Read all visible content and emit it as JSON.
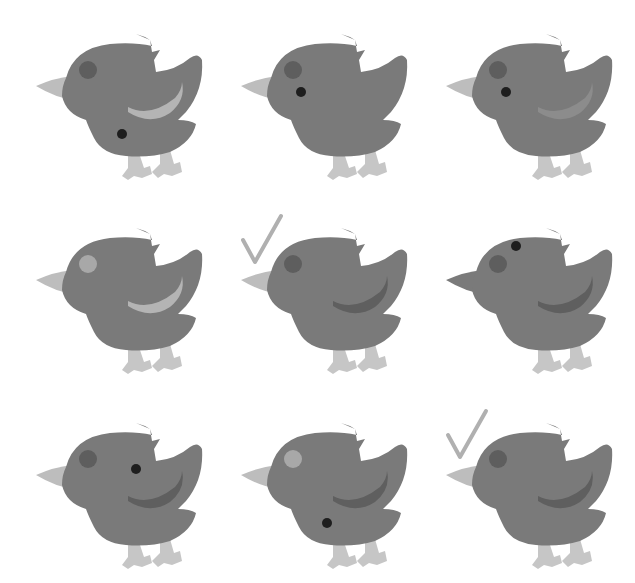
{
  "puzzle": {
    "layout": {
      "rows": 3,
      "cols": 3
    },
    "colors": {
      "body": "#7a7a7a",
      "beak": "#bdbdbd",
      "feet": "#c6c6c6",
      "cheek_dark": "#5e5e5e",
      "cheek_light": "#a8a8a8",
      "eye": "#1e1e1e",
      "wing_dark": "#5f5f5f",
      "wing_light": "#b4b4b4",
      "wing_mid": "#8c8c8c",
      "check": "#b0b0b0",
      "background": "#ffffff"
    },
    "birds": [
      {
        "id": "bird-1",
        "row": 0,
        "col": 0,
        "cheek": "dark",
        "eye": "belly",
        "wing": "light",
        "check": false
      },
      {
        "id": "bird-2",
        "row": 0,
        "col": 1,
        "cheek": "dark",
        "eye": "normal",
        "wing": "none",
        "check": false
      },
      {
        "id": "bird-3",
        "row": 0,
        "col": 2,
        "cheek": "dark",
        "eye": "normal",
        "wing": "mid",
        "check": false
      },
      {
        "id": "bird-4",
        "row": 1,
        "col": 0,
        "cheek": "light",
        "eye": "none",
        "wing": "light",
        "check": false
      },
      {
        "id": "bird-5",
        "row": 1,
        "col": 1,
        "cheek": "dark",
        "eye": "none",
        "wing": "dark",
        "check": true
      },
      {
        "id": "bird-6",
        "row": 1,
        "col": 2,
        "cheek": "dark",
        "eye": "high",
        "wing": "dark",
        "check": false,
        "beak": "body"
      },
      {
        "id": "bird-7",
        "row": 2,
        "col": 0,
        "cheek": "dark",
        "eye": "wing",
        "wing": "dark",
        "check": false
      },
      {
        "id": "bird-8",
        "row": 2,
        "col": 1,
        "cheek": "light",
        "eye": "belly",
        "wing": "dark",
        "check": false
      },
      {
        "id": "bird-9",
        "row": 2,
        "col": 2,
        "cheek": "dark",
        "eye": "none",
        "wing": "dark",
        "check": true
      }
    ]
  }
}
